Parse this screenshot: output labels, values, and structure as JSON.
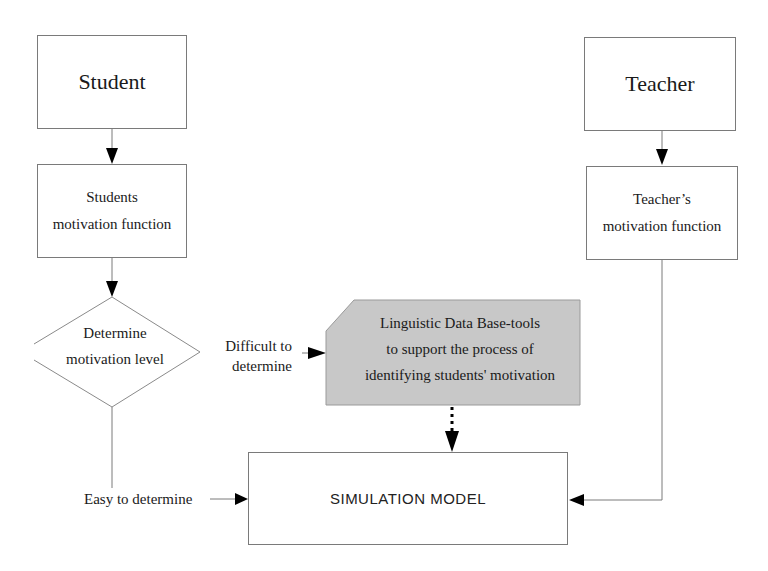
{
  "diagram": {
    "nodes": {
      "student": {
        "label": "Student"
      },
      "student_motivation": {
        "line1": "Students",
        "line2": "motivation  function"
      },
      "decision": {
        "line1": "Determine",
        "line2": "motivation level"
      },
      "linguistic_db": {
        "line1": "Linguistic Data Base-tools",
        "line2": "to support the process of",
        "line3": "identifying  students' motivation",
        "fill_color": "#c8c8c8"
      },
      "simulation_model": {
        "label": "SIMULATION MODEL"
      },
      "teacher": {
        "label": "Teacher"
      },
      "teacher_motivation": {
        "line1": "Teacher’s",
        "line2": "motivation function"
      }
    },
    "edges": {
      "difficult": {
        "line1": "Difficult to",
        "line2": "determine"
      },
      "easy": {
        "label": "Easy to determine"
      }
    },
    "colors": {
      "line": "#7a7a7a",
      "arrowhead": "#000000",
      "gray_box": "#c8c8c8"
    }
  }
}
